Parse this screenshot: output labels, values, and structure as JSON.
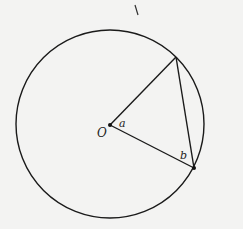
{
  "diagram": {
    "type": "circle-geometry",
    "circle": {
      "cx": 110,
      "cy": 124,
      "r": 94
    },
    "points": {
      "center": {
        "label": "O",
        "x": 110,
        "y": 125
      },
      "top": {
        "x": 176,
        "y": 57
      },
      "bottom_right": {
        "x": 194,
        "y": 168
      }
    },
    "angle_labels": {
      "at_center": "a",
      "at_bottom_right": "b"
    },
    "stroke_color": "#1a1a1a",
    "background_color": "#f3f3f2",
    "stray_mark": {
      "x1": 135,
      "y1": 4,
      "x2": 138,
      "y2": 15
    }
  }
}
